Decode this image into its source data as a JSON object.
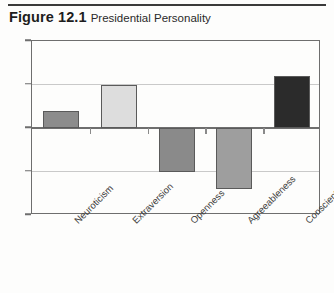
{
  "figure": {
    "number": "Figure 12.1",
    "title": "Presidential Personality"
  },
  "chart_data": {
    "type": "bar",
    "title": "Presidential Personality",
    "xlabel": "",
    "ylabel": "",
    "ylim": [
      40,
      60
    ],
    "yticks": [
      40,
      45,
      50,
      55,
      60
    ],
    "ytick_labels": [
      "40",
      "45",
      "50",
      "55",
      "60"
    ],
    "baseline": 50,
    "grid": true,
    "legend": "none",
    "categories": [
      "Neuroticism",
      "Extraversion",
      "Openness",
      "Agreeableness",
      "Conscientiousness"
    ],
    "values": [
      52,
      55,
      45,
      43,
      56
    ],
    "bar_colors": [
      "#8c8c8c",
      "#dddddd",
      "#8a8a8a",
      "#9e9e9e",
      "#2b2b2b"
    ],
    "bar_edge_color": "#5a5a5a",
    "grid_color": "#c9c9c9",
    "axis_color": "#6e6e6e"
  }
}
